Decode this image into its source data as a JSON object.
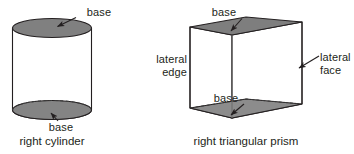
{
  "figure": {
    "colors": {
      "stroke": "#231f20",
      "fill_shaded": "#808080",
      "fill_shaded_dark": "#6e6e6e",
      "fill_body": "#ffffff",
      "text": "#231f20",
      "background": "#ffffff"
    },
    "shapes": [
      {
        "id": "right-cylinder",
        "caption": "right cylinder",
        "labels": [
          {
            "id": "cylinder-top-base",
            "text": "base"
          },
          {
            "id": "cylinder-bottom-base",
            "text": "base"
          }
        ]
      },
      {
        "id": "right-triangular-prism",
        "caption": "right triangular prism",
        "labels": [
          {
            "id": "prism-top-base",
            "text": "base"
          },
          {
            "id": "prism-bottom-base",
            "text": "base"
          },
          {
            "id": "prism-lateral-edge",
            "text_line1": "lateral",
            "text_line2": "edge"
          },
          {
            "id": "prism-lateral-face",
            "text_line1": "lateral",
            "text_line2": "face"
          }
        ]
      }
    ]
  },
  "cylinder": {
    "caption": "right cylinder",
    "label_top": "base",
    "label_bottom": "base"
  },
  "prism": {
    "caption": "right triangular prism",
    "label_top": "base",
    "label_bottom": "base",
    "lateral_edge_line1": "lateral",
    "lateral_edge_line2": "edge",
    "lateral_face_line1": "lateral",
    "lateral_face_line2": "face"
  }
}
